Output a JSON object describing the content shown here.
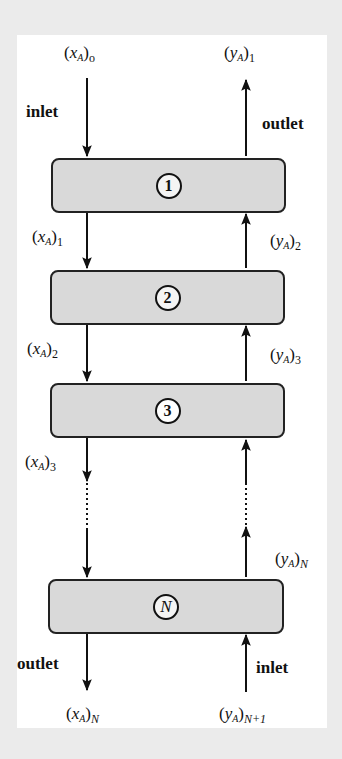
{
  "diagram": {
    "stages": [
      {
        "id": "1",
        "label": "1"
      },
      {
        "id": "2",
        "label": "2"
      },
      {
        "id": "3",
        "label": "3"
      },
      {
        "id": "N",
        "label": "N"
      }
    ],
    "flow_labels": {
      "liquid_in": {
        "var": "x",
        "sub": "A",
        "index": "o"
      },
      "liquid_1": {
        "var": "x",
        "sub": "A",
        "index": "1"
      },
      "liquid_2": {
        "var": "x",
        "sub": "A",
        "index": "2"
      },
      "liquid_3": {
        "var": "x",
        "sub": "A",
        "index": "3"
      },
      "liquid_out": {
        "var": "x",
        "sub": "A",
        "index": "N"
      },
      "vapor_out": {
        "var": "y",
        "sub": "A",
        "index": "1"
      },
      "vapor_2": {
        "var": "y",
        "sub": "A",
        "index": "2"
      },
      "vapor_3": {
        "var": "y",
        "sub": "A",
        "index": "3"
      },
      "vapor_N": {
        "var": "y",
        "sub": "A",
        "index": "N"
      },
      "vapor_in": {
        "var": "y",
        "sub": "A",
        "index": "N+1"
      }
    },
    "words": {
      "top_left": "inlet",
      "top_right": "outlet",
      "bottom_left": "outlet",
      "bottom_right": "inlet"
    },
    "colors": {
      "background": "#ebebeb",
      "panel": "#ffffff",
      "stage_fill": "#d9d9d9",
      "stroke": "#222222"
    }
  }
}
